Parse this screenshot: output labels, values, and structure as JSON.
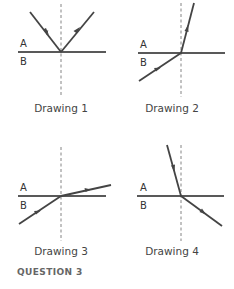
{
  "figure": {
    "question_label": "QUESTION 3",
    "colors": {
      "ray": "#444444",
      "boundary": "#222222",
      "normal": "#666666",
      "text": "#444444",
      "question": "#666666"
    },
    "drawings": [
      {
        "caption": "Drawing 1",
        "medium_top": "A",
        "medium_bottom": "B",
        "description": "ray in A reflects off boundary back into A"
      },
      {
        "caption": "Drawing 2",
        "medium_top": "A",
        "medium_bottom": "B",
        "description": "ray from B refracts into A bending toward normal"
      },
      {
        "caption": "Drawing 3",
        "medium_top": "A",
        "medium_bottom": "B",
        "description": "ray from B refracts into A bending away from normal"
      },
      {
        "caption": "Drawing 4",
        "medium_top": "A",
        "medium_bottom": "B",
        "description": "ray from A refracts into B bending away from normal"
      }
    ]
  }
}
